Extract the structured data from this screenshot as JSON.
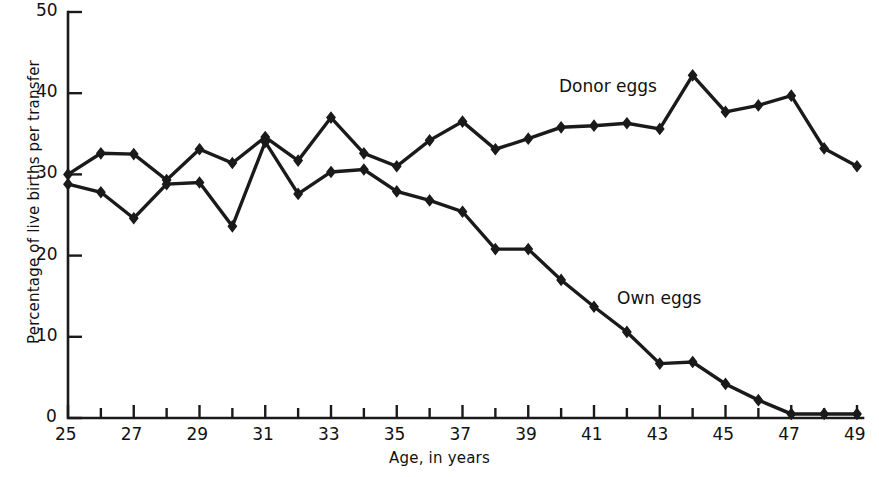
{
  "chart_data": {
    "type": "line",
    "title": "",
    "xlabel": "Age, in years",
    "ylabel": "Percentage of live births per transfer",
    "xlim": [
      25,
      49
    ],
    "ylim": [
      0,
      50
    ],
    "grid": false,
    "legend_position": "inline-annotations",
    "x_tick_step": 1,
    "x_label_step": 2,
    "y_tick_step": 10,
    "x": [
      25,
      26,
      27,
      28,
      29,
      30,
      31,
      32,
      33,
      34,
      35,
      36,
      37,
      38,
      39,
      40,
      41,
      42,
      43,
      44,
      45,
      46,
      47,
      48,
      49
    ],
    "xticklabels": [
      "25",
      "27",
      "29",
      "31",
      "33",
      "35",
      "37",
      "39",
      "41",
      "43",
      "45",
      "47",
      "49"
    ],
    "yticklabels": [
      "0",
      "10",
      "20",
      "30",
      "40",
      "50"
    ],
    "series": [
      {
        "name": "Donor eggs",
        "values": [
          30.0,
          32.6,
          32.5,
          29.3,
          33.1,
          31.4,
          34.6,
          31.7,
          37.0,
          32.6,
          31.0,
          34.2,
          36.5,
          33.1,
          34.4,
          35.8,
          36.0,
          36.3,
          35.6,
          42.2,
          37.7,
          38.5,
          39.7,
          33.2,
          31.0
        ]
      },
      {
        "name": "Own eggs",
        "values": [
          28.8,
          27.8,
          24.6,
          28.8,
          29.0,
          23.6,
          34.0,
          27.6,
          30.3,
          30.6,
          27.9,
          26.8,
          25.4,
          20.8,
          20.8,
          17.0,
          13.7,
          10.6,
          6.7,
          6.9,
          4.2,
          2.2,
          0.5,
          0.5,
          0.5
        ]
      }
    ],
    "annotations": [
      {
        "text": "Donor eggs",
        "series": "Donor eggs"
      },
      {
        "text": "Own eggs",
        "series": "Own eggs"
      }
    ],
    "style": {
      "line_color": "#1a1a1a",
      "marker": "diamond",
      "line_width": 3.4,
      "axis_color": "#1a1a1a"
    }
  },
  "axes": {
    "y_title": "Percentage of live births per transfer",
    "x_title": "Age, in years"
  }
}
